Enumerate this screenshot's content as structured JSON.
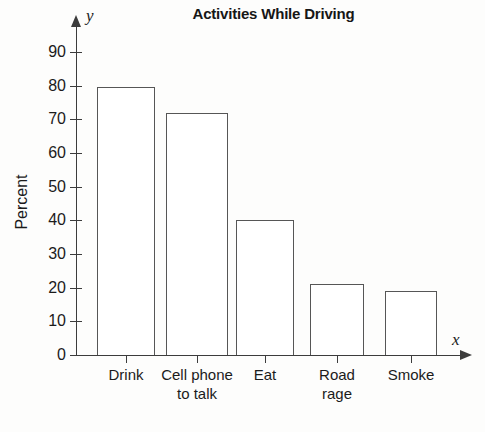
{
  "chart_data": {
    "type": "bar",
    "title": "Activities While Driving",
    "categories": [
      "Drink",
      "Cell phone\nto talk",
      "Eat",
      "Road\nrage",
      "Smoke"
    ],
    "values": [
      79.5,
      72,
      40,
      21,
      19
    ],
    "xlabel": "x",
    "ylabel": "Percent",
    "yaxis_name": "y",
    "ylim": [
      0,
      90
    ],
    "ytick_labels": [
      "90",
      "80",
      "70",
      "60",
      "50",
      "40",
      "30",
      "20",
      "10",
      "0"
    ],
    "ytick_values": [
      90,
      80,
      70,
      60,
      50,
      40,
      30,
      20,
      10,
      0
    ],
    "grid": false,
    "legend": false,
    "bar_fill_color": "#ffffff",
    "bar_outline_color": "#565656",
    "axis_color": "#3c3c3c",
    "background_color": "#fdfdfc",
    "text_color": "#1b1b1b"
  }
}
